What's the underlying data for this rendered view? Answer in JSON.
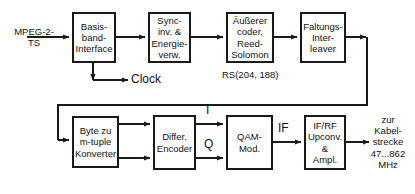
{
  "diagram": {
    "line_color": "#1a1a1a",
    "background": "#ffffff",
    "blocks": [
      {
        "id": "baseband",
        "lines": [
          "Basis-",
          "band-",
          "Interface"
        ]
      },
      {
        "id": "sync_energy",
        "lines": [
          "Sync-",
          "inv. &",
          "Energie-",
          "verw."
        ]
      },
      {
        "id": "outer_coder",
        "lines": [
          "Äußerer",
          "coder,",
          "Reed-",
          "Solomon"
        ]
      },
      {
        "id": "interleaver",
        "lines": [
          "Faltungs-",
          "Inter-",
          "leaver"
        ]
      },
      {
        "id": "byte_converter",
        "lines": [
          "Byte zu",
          "m-tuple",
          "Konverter"
        ]
      },
      {
        "id": "diff_encoder",
        "lines": [
          "Differ.",
          "Encoder"
        ]
      },
      {
        "id": "qam_mod",
        "lines": [
          "QAM-",
          "Mod."
        ]
      },
      {
        "id": "upconverter",
        "lines": [
          "IF/RF",
          "Upconv.",
          "&",
          "Ampl."
        ]
      }
    ],
    "labels": {
      "input": [
        "MPEG-2-",
        "TS"
      ],
      "clock": "Clock",
      "rs_code": "RS(204, 188)",
      "i_branch": "I",
      "q_branch": "Q",
      "if_signal": "IF",
      "output": [
        "zur",
        "Kabel-",
        "strecke",
        "47...862",
        "MHz"
      ]
    }
  }
}
